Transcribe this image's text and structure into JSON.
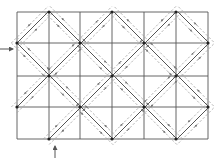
{
  "diagram": {
    "type": "grid-with-diamond-lattice",
    "colors": {
      "background": "#ffffff",
      "grid": "#555555",
      "diagonal": "#555555",
      "dashed": "#999999",
      "vertex": "#222222",
      "arrow": "#555555"
    },
    "grid": {
      "x_lines": [
        17,
        49,
        80,
        112,
        144,
        176,
        208
      ],
      "y_lines": [
        12,
        43,
        76,
        107,
        139
      ],
      "columns": 6,
      "rows": 4
    },
    "diagonals": {
      "sum_constants": [
        60,
        124,
        188,
        252,
        316
      ],
      "diff_constants": [
        -26,
        38,
        102,
        166
      ],
      "dashed_offset": 4
    },
    "vertices": [
      [
        49,
        12
      ],
      [
        112,
        12
      ],
      [
        176,
        12
      ],
      [
        17,
        43
      ],
      [
        80,
        43
      ],
      [
        144,
        43
      ],
      [
        208,
        43
      ],
      [
        49,
        76
      ],
      [
        112,
        76
      ],
      [
        176,
        76
      ],
      [
        17,
        107
      ],
      [
        80,
        107
      ],
      [
        144,
        107
      ],
      [
        208,
        107
      ],
      [
        49,
        139
      ],
      [
        112,
        139
      ],
      [
        176,
        139
      ]
    ],
    "input_arrows": [
      {
        "name": "left-input-arrow",
        "x1": 0,
        "y1": 49,
        "x2": 13,
        "y2": 49,
        "direction": "right"
      },
      {
        "name": "bottom-input-arrow",
        "x1": 55,
        "y1": 158,
        "x2": 55,
        "y2": 146,
        "direction": "up"
      }
    ]
  }
}
